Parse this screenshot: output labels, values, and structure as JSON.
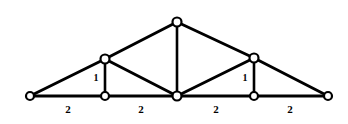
{
  "figure": {
    "name": "truss-structure-diagram",
    "type": "statics-truss-line-diagram",
    "background_color": "#ffffff",
    "line_color": "#000000",
    "node_fill_color": "#ffffff",
    "width": 348,
    "height": 124
  },
  "nodes": [
    {
      "id": "A",
      "label": "left-support",
      "x": 30,
      "y": 96,
      "r": 4.0
    },
    {
      "id": "B",
      "label": "bottom-left",
      "x": 105,
      "y": 96,
      "r": 4.0
    },
    {
      "id": "C",
      "label": "bottom-center",
      "x": 177,
      "y": 96,
      "r": 4.5
    },
    {
      "id": "D",
      "label": "bottom-right",
      "x": 254,
      "y": 96,
      "r": 4.0
    },
    {
      "id": "E",
      "label": "right-support",
      "x": 328,
      "y": 96,
      "r": 4.0
    },
    {
      "id": "F",
      "label": "upper-left",
      "x": 105,
      "y": 59,
      "r": 4.5
    },
    {
      "id": "G",
      "label": "apex",
      "x": 177,
      "y": 22,
      "r": 4.5
    },
    {
      "id": "H",
      "label": "upper-right",
      "x": 254,
      "y": 58,
      "r": 4.5
    }
  ],
  "members": [
    {
      "id": "m1",
      "from": "A",
      "to": "B",
      "group": "bottom-chord",
      "width": 3.0
    },
    {
      "id": "m2",
      "from": "B",
      "to": "C",
      "group": "bottom-chord",
      "width": 3.0
    },
    {
      "id": "m3",
      "from": "C",
      "to": "D",
      "group": "bottom-chord",
      "width": 3.0
    },
    {
      "id": "m4",
      "from": "D",
      "to": "E",
      "group": "bottom-chord",
      "width": 3.0
    },
    {
      "id": "m5",
      "from": "A",
      "to": "F",
      "group": "top-chord",
      "width": 3.0
    },
    {
      "id": "m6",
      "from": "F",
      "to": "G",
      "group": "top-chord",
      "width": 3.0
    },
    {
      "id": "m7",
      "from": "G",
      "to": "H",
      "group": "top-chord",
      "width": 3.0
    },
    {
      "id": "m8",
      "from": "H",
      "to": "E",
      "group": "top-chord",
      "width": 3.0
    },
    {
      "id": "m9",
      "from": "F",
      "to": "B",
      "group": "vertical-web",
      "width": 2.6
    },
    {
      "id": "m10",
      "from": "G",
      "to": "C",
      "group": "vertical-web",
      "width": 2.6
    },
    {
      "id": "m11",
      "from": "H",
      "to": "D",
      "group": "vertical-web",
      "width": 2.6
    },
    {
      "id": "m12",
      "from": "F",
      "to": "C",
      "group": "diagonal-web",
      "width": 3.0
    },
    {
      "id": "m13",
      "from": "H",
      "to": "C",
      "group": "diagonal-web",
      "width": 3.0
    }
  ],
  "labels": {
    "bottom_dimensions": [
      {
        "id": "bay-1",
        "text": "2",
        "x": 68,
        "y": 110
      },
      {
        "id": "bay-2",
        "text": "2",
        "x": 141,
        "y": 110
      },
      {
        "id": "bay-3",
        "text": "2",
        "x": 216,
        "y": 110
      },
      {
        "id": "bay-4",
        "text": "2",
        "x": 290,
        "y": 110
      }
    ],
    "vertical_dimensions": [
      {
        "id": "left-post",
        "text": "1",
        "x": 96,
        "y": 79
      },
      {
        "id": "right-post",
        "text": "1",
        "x": 245,
        "y": 79
      }
    ]
  }
}
